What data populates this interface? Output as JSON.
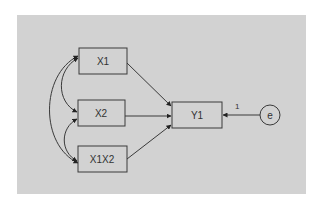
{
  "diagram": {
    "type": "path-diagram",
    "background": "#d2d2d2",
    "stroke": "#3a3a3a",
    "nodes": [
      {
        "id": "X1",
        "label": "X1",
        "shape": "rect"
      },
      {
        "id": "X2",
        "label": "X2",
        "shape": "rect"
      },
      {
        "id": "X1X2",
        "label": "X1X2",
        "shape": "rect"
      },
      {
        "id": "Y1",
        "label": "Y1",
        "shape": "rect"
      },
      {
        "id": "e",
        "label": "e",
        "shape": "circle"
      }
    ],
    "edges": [
      {
        "from": "X1",
        "to": "Y1",
        "type": "directed",
        "label": ""
      },
      {
        "from": "X2",
        "to": "Y1",
        "type": "directed",
        "label": ""
      },
      {
        "from": "X1X2",
        "to": "Y1",
        "type": "directed",
        "label": ""
      },
      {
        "from": "e",
        "to": "Y1",
        "type": "directed",
        "label": "1"
      },
      {
        "from": "X1",
        "to": "X2",
        "type": "covariance",
        "label": ""
      },
      {
        "from": "X2",
        "to": "X1X2",
        "type": "covariance",
        "label": ""
      },
      {
        "from": "X1",
        "to": "X1X2",
        "type": "covariance",
        "label": ""
      }
    ]
  }
}
